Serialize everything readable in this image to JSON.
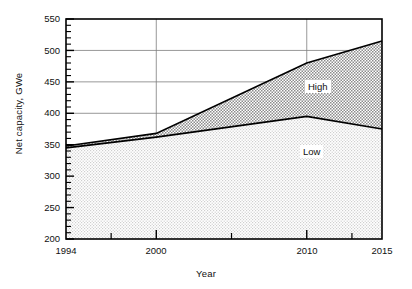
{
  "chart_data": {
    "type": "area",
    "title": "",
    "xlabel": "Year",
    "ylabel": "Net capacity, GWe",
    "xlim": [
      1994,
      2015
    ],
    "ylim": [
      200,
      550
    ],
    "grid": true,
    "legend_position": "inline-annotations",
    "x": [
      1994,
      2000,
      2010,
      2015
    ],
    "series": [
      {
        "name": "Low",
        "values": [
          345,
          362,
          395,
          375
        ],
        "fill": "#e6e6e6",
        "stroke": "#000000"
      },
      {
        "name": "High",
        "values": [
          348,
          368,
          480,
          515
        ],
        "fill": "#c8c8c8",
        "stroke": "#000000"
      }
    ],
    "yticks": [
      200,
      250,
      300,
      350,
      400,
      450,
      500,
      550
    ],
    "ytick_labels": [
      "200",
      "250",
      "300",
      "350",
      "400",
      "450",
      "500",
      "550"
    ],
    "yminor_step": 10,
    "xticks": [
      1994,
      2000,
      2010,
      2015
    ],
    "xtick_labels": [
      "1994",
      "2000",
      "2010",
      "2015"
    ],
    "xminor_ticks": [
      1997,
      2005,
      2013
    ],
    "gridlines_y": [
      400,
      450,
      500
    ],
    "gridlines_x": [
      2000,
      2010
    ],
    "annotations": [
      {
        "text": "High",
        "x": 2012.0,
        "y": 450
      },
      {
        "text": "Low",
        "x": 2011.6,
        "y": 338
      }
    ]
  },
  "axes": {
    "y_title": "Net capacity, GWe",
    "x_title": "Year"
  },
  "ticks": {
    "y": [
      "550",
      "500",
      "450",
      "400",
      "350",
      "300",
      "250",
      "200"
    ],
    "x": [
      "1994",
      "2000",
      "2010",
      "2015"
    ]
  },
  "labels": {
    "high": "High",
    "low": "Low"
  },
  "colors": {
    "axis": "#000000",
    "grid": "#808080",
    "low_fill": "#e8e8e8",
    "high_fill": "#cccccc",
    "text": "#111111",
    "background": "#ffffff"
  }
}
